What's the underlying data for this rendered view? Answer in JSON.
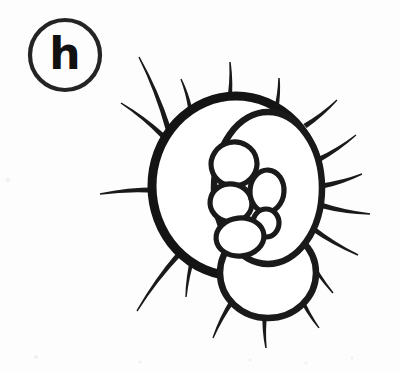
{
  "figure": {
    "panel_label": "h",
    "caption": "",
    "background_color": "#fdfdfd",
    "ink_color": "#1a1a1a",
    "canvas": {
      "width": 400,
      "height": 372
    }
  },
  "label_badge": {
    "text": "h",
    "shape": "circle",
    "center_x": 65,
    "center_y": 55,
    "radius": 35,
    "stroke_color": "#242424",
    "text_color": "#111111"
  },
  "drawing": {
    "main_body": {
      "name": "outer-cell-wall",
      "center_x": 236,
      "center_y": 186,
      "radius_x": 84,
      "radius_y": 90,
      "stroke_width": 9,
      "fill": "#ffffff"
    },
    "lower_lobe": {
      "name": "lower-lobe",
      "center_x": 268,
      "center_y": 273,
      "radius_x": 48,
      "radius_y": 45,
      "stroke_width": 7
    },
    "inner_large_lobe": {
      "name": "inner-large-lobe",
      "center_x": 268,
      "center_y": 188,
      "radius_x": 54,
      "radius_y": 76,
      "stroke_width": 6.5
    },
    "inner_cells": [
      {
        "name": "inner-cell-1",
        "cx": 234,
        "cy": 164,
        "rx": 23,
        "ry": 22,
        "rot": -12
      },
      {
        "name": "inner-cell-2",
        "cx": 231,
        "cy": 203,
        "rx": 21,
        "ry": 19,
        "rot": 8
      },
      {
        "name": "inner-cell-3",
        "cx": 267,
        "cy": 191,
        "rx": 17,
        "ry": 21,
        "rot": 4
      },
      {
        "name": "inner-cell-4",
        "cx": 266,
        "cy": 223,
        "rx": 13,
        "ry": 14,
        "rot": 0
      },
      {
        "name": "inner-cell-5",
        "cx": 240,
        "cy": 237,
        "rx": 24,
        "ry": 19,
        "rot": -6
      }
    ],
    "spine_count": 17,
    "spines": [
      {
        "name": "spine-upper-left-long",
        "x1": 168,
        "y1": 128,
        "x2": 139,
        "y2": 57,
        "w1": 5.5,
        "w2": 1.4
      },
      {
        "name": "spine-upper-left-mid",
        "x1": 163,
        "y1": 136,
        "x2": 121,
        "y2": 103,
        "w1": 5.0,
        "w2": 1.4
      },
      {
        "name": "spine-upper-left-short",
        "x1": 190,
        "y1": 108,
        "x2": 181,
        "y2": 79,
        "w1": 4.0,
        "w2": 1.3
      },
      {
        "name": "spine-top-left-vertical",
        "x1": 229,
        "y1": 104,
        "x2": 230,
        "y2": 62,
        "w1": 5.0,
        "w2": 1.5
      },
      {
        "name": "spine-top-right-vertical",
        "x1": 276,
        "y1": 110,
        "x2": 279,
        "y2": 78,
        "w1": 4.6,
        "w2": 1.5
      },
      {
        "name": "spine-upper-right-a",
        "x1": 305,
        "y1": 126,
        "x2": 337,
        "y2": 100,
        "w1": 5.2,
        "w2": 1.4
      },
      {
        "name": "spine-upper-right-b",
        "x1": 318,
        "y1": 160,
        "x2": 356,
        "y2": 135,
        "w1": 5.2,
        "w2": 1.4
      },
      {
        "name": "spine-right-a",
        "x1": 322,
        "y1": 186,
        "x2": 362,
        "y2": 174,
        "w1": 5.4,
        "w2": 1.4
      },
      {
        "name": "spine-right-b",
        "x1": 320,
        "y1": 205,
        "x2": 370,
        "y2": 214,
        "w1": 5.4,
        "w2": 1.5
      },
      {
        "name": "spine-right-c",
        "x1": 312,
        "y1": 228,
        "x2": 358,
        "y2": 255,
        "w1": 5.2,
        "w2": 1.5
      },
      {
        "name": "spine-lower-right",
        "x1": 305,
        "y1": 252,
        "x2": 333,
        "y2": 293,
        "w1": 5.0,
        "w2": 1.4
      },
      {
        "name": "spine-left-horizontal",
        "x1": 156,
        "y1": 190,
        "x2": 100,
        "y2": 194,
        "w1": 5.6,
        "w2": 1.6
      },
      {
        "name": "spine-lower-left-long",
        "x1": 180,
        "y1": 253,
        "x2": 137,
        "y2": 311,
        "w1": 5.4,
        "w2": 1.4
      },
      {
        "name": "spine-lower-left-short",
        "x1": 193,
        "y1": 257,
        "x2": 186,
        "y2": 297,
        "w1": 4.6,
        "w2": 1.4
      },
      {
        "name": "spine-bottom-left",
        "x1": 233,
        "y1": 300,
        "x2": 213,
        "y2": 338,
        "w1": 5.0,
        "w2": 1.4
      },
      {
        "name": "spine-bottom-center",
        "x1": 265,
        "y1": 312,
        "x2": 266,
        "y2": 348,
        "w1": 5.0,
        "w2": 1.5
      },
      {
        "name": "spine-bottom-right",
        "x1": 300,
        "y1": 296,
        "x2": 319,
        "y2": 328,
        "w1": 4.6,
        "w2": 1.4
      }
    ]
  },
  "artifacts": {
    "note": "faint scanner specks along the lower edge",
    "specks": [
      {
        "x": 36,
        "y": 357,
        "r": 2.0
      },
      {
        "x": 140,
        "y": 362,
        "r": 1.6
      },
      {
        "x": 250,
        "y": 360,
        "r": 1.4
      },
      {
        "x": 306,
        "y": 363,
        "r": 1.6
      },
      {
        "x": 352,
        "y": 358,
        "r": 1.5
      },
      {
        "x": 8,
        "y": 180,
        "r": 2.2
      }
    ]
  }
}
